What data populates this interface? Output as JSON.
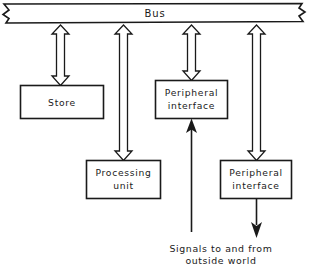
{
  "diagram": {
    "colors": {
      "ink": "#1a1a1a",
      "paper": "#ffffff"
    },
    "bus": {
      "label": "Bus",
      "note": "horizontal bus bar with torn/broken ends at left and right"
    },
    "blocks": [
      {
        "id": "store",
        "label": "Store",
        "lines": [
          "Store"
        ]
      },
      {
        "id": "peripheral-interface-1",
        "label": "Peripheral interface",
        "lines": [
          "Peripheral",
          "interface"
        ]
      },
      {
        "id": "processing-unit",
        "label": "Processing unit",
        "lines": [
          "Processing",
          "unit"
        ]
      },
      {
        "id": "peripheral-interface-2",
        "label": "Peripheral interface",
        "lines": [
          "Peripheral",
          "interface"
        ]
      }
    ],
    "connectors": [
      {
        "id": "bus-to-store",
        "kind": "double-headed-hollow-arrow",
        "from": "bus",
        "to": "store"
      },
      {
        "id": "bus-to-processing-unit",
        "kind": "double-headed-hollow-arrow",
        "from": "bus",
        "to": "processing-unit"
      },
      {
        "id": "bus-to-peripheral-interface-1",
        "kind": "double-headed-hollow-arrow",
        "from": "bus",
        "to": "peripheral-interface-1"
      },
      {
        "id": "bus-to-peripheral-interface-2",
        "kind": "double-headed-hollow-arrow",
        "from": "bus",
        "to": "peripheral-interface-2"
      },
      {
        "id": "outside-world-in",
        "kind": "solid-arrow-up",
        "from": "outside world",
        "to": "peripheral-interface-1"
      },
      {
        "id": "outside-world-out",
        "kind": "solid-arrow-down",
        "from": "peripheral-interface-2",
        "to": "outside world"
      }
    ],
    "caption": {
      "lines": [
        "Signals to and from",
        "outside world"
      ],
      "text": "Signals to and from outside world"
    }
  }
}
